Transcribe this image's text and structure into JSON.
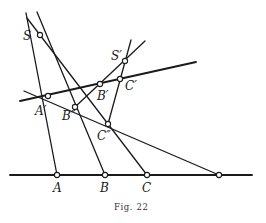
{
  "figure": {
    "caption": "Fig. 22",
    "points": {
      "S": "S",
      "S_prime": "S′",
      "A_prime": "A′",
      "B_prime": "B′",
      "C_prime": "C′",
      "B_double_prime": "B″",
      "C_double_prime": "C″",
      "A": "A",
      "B": "B",
      "C": "C"
    }
  }
}
